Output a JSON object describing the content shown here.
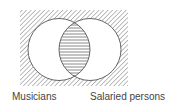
{
  "diagram": {
    "type": "venn",
    "sets": [
      {
        "name": "Musicians",
        "shading": "none"
      },
      {
        "name": "Salaried persons",
        "shading": "none"
      }
    ],
    "regions": {
      "intersection": {
        "shading": "horizontal-lines"
      },
      "outside_both": {
        "shading": "diagonal-hatch"
      }
    },
    "labels": {
      "left": "Musicians",
      "right": "Salaried persons"
    },
    "colors": {
      "stroke": "#555555",
      "hatch": "#777777",
      "text": "#444444",
      "background": "#ffffff"
    }
  }
}
